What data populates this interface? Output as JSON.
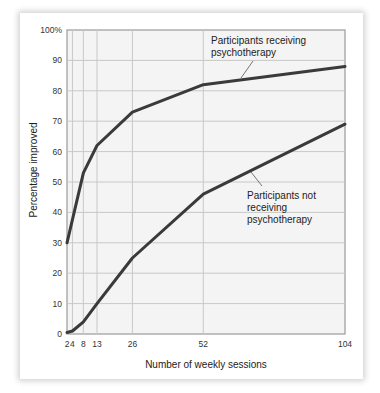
{
  "chart_data": {
    "type": "line",
    "title": "",
    "xlabel": "Number of weekly sessions",
    "ylabel": "Percentage improved",
    "x": [
      2,
      4,
      8,
      13,
      26,
      52,
      104
    ],
    "x_tick_labels": [
      "2",
      "4",
      "8",
      "13",
      "26",
      "52",
      "104"
    ],
    "y_tick_labels": [
      "0",
      "10",
      "20",
      "30",
      "40",
      "50",
      "60",
      "70",
      "80",
      "90",
      "100%"
    ],
    "ylim": [
      0,
      100
    ],
    "grid": true,
    "series": [
      {
        "name": "Participants receiving psychotherapy",
        "values": [
          30,
          null,
          53,
          62,
          73,
          82,
          88
        ]
      },
      {
        "name": "Participants not receiving psychotherapy",
        "values": [
          0.5,
          1,
          4,
          10,
          25,
          46,
          69
        ]
      }
    ],
    "annotations": [
      {
        "lines": [
          "Participants receiving",
          "psychotherapy"
        ],
        "series": 0
      },
      {
        "lines": [
          "Participants not",
          "receiving",
          "psychotherapy"
        ],
        "series": 1
      }
    ],
    "legend": "inline annotations"
  },
  "colors": {
    "line": "#3a3a3a",
    "grid": "#c8c8c8",
    "plot_bg": "#f4f4f4",
    "frame": "#9a9a9a"
  }
}
